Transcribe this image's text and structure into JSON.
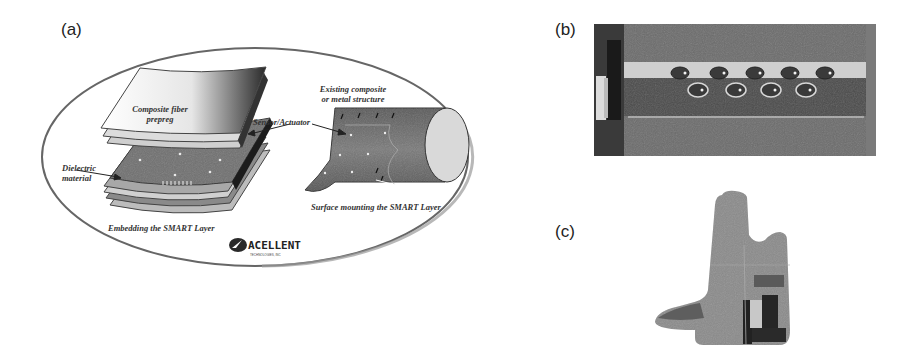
{
  "figure": {
    "panels": [
      {
        "label": "(a)",
        "title": "SMART Layer integration schematic",
        "annotations": {
          "prepreg": [
            "Composite fiber",
            "prepreg"
          ],
          "sensor": "Sensor/Actuator",
          "dielectric": [
            "Dielectric",
            "material"
          ],
          "embedding": "Embedding the SMART Layer",
          "existing": [
            "Existing composite",
            "or metal structure"
          ],
          "surface": "Surface mounting the SMART Layer"
        },
        "logo": {
          "name": "ACELLENT",
          "subtitle": "TECHNOLOGIES, INC"
        }
      },
      {
        "label": "(b)",
        "title": "Photo of SMART Layer with sensors on structure",
        "sensor_rows": [
          5,
          4
        ]
      },
      {
        "label": "(c)",
        "title": "Photo of structural component cross-section"
      }
    ],
    "colors": {
      "background": "#ffffff",
      "panel_gray": "#6e6e6e",
      "dark": "#2e2e2e",
      "light": "#d8d8d8"
    }
  }
}
